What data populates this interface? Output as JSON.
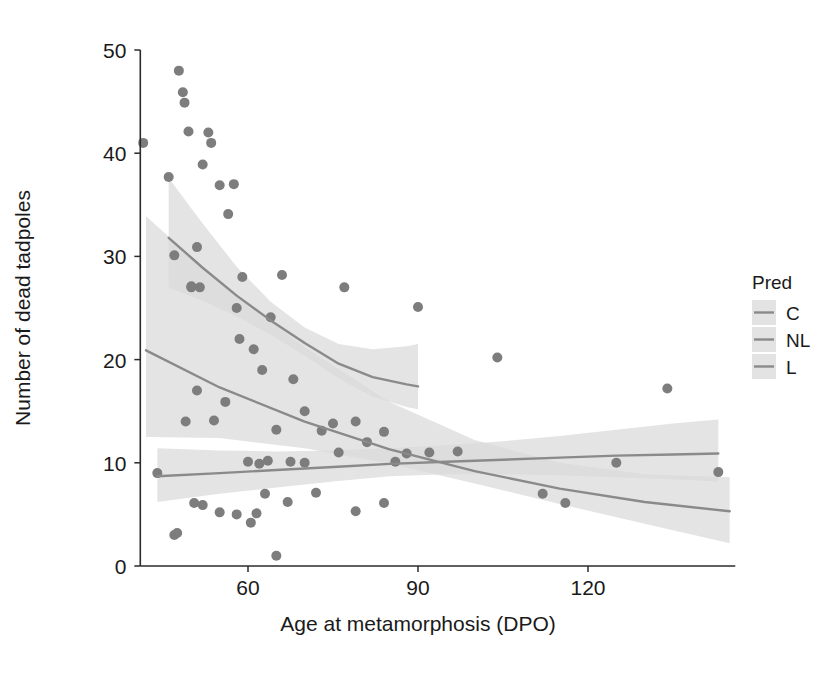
{
  "chart_data": {
    "type": "scatter",
    "title": "",
    "subtitle": "",
    "xlabel": "Age at metamorphosis (DPO)",
    "ylabel": "Number of dead tadpoles",
    "xlim": [
      41,
      146
    ],
    "ylim": [
      0,
      50
    ],
    "xticks": [
      60,
      90,
      120
    ],
    "xtick_labels": [
      "60",
      "90",
      "120"
    ],
    "yticks": [
      0,
      10,
      20,
      30,
      40,
      50
    ],
    "ytick_labels": [
      "0",
      "10",
      "20",
      "30",
      "40",
      "50"
    ],
    "grid": false,
    "legend": {
      "title": "Pred",
      "position": "right",
      "entries": [
        {
          "label": "C",
          "color": "#8a8a8a",
          "band_color": "#d9d9d9"
        },
        {
          "label": "NL",
          "color": "#8a8a8a",
          "band_color": "#d9d9d9"
        },
        {
          "label": "L",
          "color": "#8a8a8a",
          "band_color": "#d9d9d9"
        }
      ]
    },
    "point_color": "#7d7d7d",
    "point_size": 5,
    "series": [
      {
        "name": "C",
        "fit_x": [
          44,
          55,
          65,
          75,
          85,
          95,
          105,
          115,
          125,
          135,
          143
        ],
        "fit_y": [
          8.7,
          9.0,
          9.3,
          9.6,
          9.9,
          10.1,
          10.3,
          10.5,
          10.7,
          10.8,
          10.9
        ],
        "band_lo": [
          6.2,
          7.0,
          7.6,
          8.2,
          8.7,
          8.9,
          8.9,
          8.8,
          8.6,
          8.4,
          8.2
        ],
        "band_hi": [
          11.4,
          11.2,
          11.1,
          11.2,
          11.4,
          11.7,
          12.1,
          12.6,
          13.2,
          13.8,
          14.2
        ],
        "band_x_range": [
          44,
          134
        ],
        "points": [
          {
            "x": 44.0,
            "y": 9.0
          },
          {
            "x": 50.5,
            "y": 6.1
          },
          {
            "x": 52.0,
            "y": 5.9
          },
          {
            "x": 55.0,
            "y": 5.2
          },
          {
            "x": 58.0,
            "y": 5.0
          },
          {
            "x": 60.5,
            "y": 4.2
          },
          {
            "x": 61.5,
            "y": 5.1
          },
          {
            "x": 63.0,
            "y": 7.0
          },
          {
            "x": 65.0,
            "y": 1.0
          },
          {
            "x": 67.0,
            "y": 6.2
          },
          {
            "x": 72.0,
            "y": 7.1
          },
          {
            "x": 79.0,
            "y": 5.3
          },
          {
            "x": 84.0,
            "y": 6.1
          },
          {
            "x": 92.0,
            "y": 11.0
          },
          {
            "x": 97.0,
            "y": 11.1
          },
          {
            "x": 104.0,
            "y": 20.2
          },
          {
            "x": 112.0,
            "y": 7.0
          },
          {
            "x": 116.0,
            "y": 6.1
          },
          {
            "x": 125.0,
            "y": 10.0
          },
          {
            "x": 134.0,
            "y": 17.2
          },
          {
            "x": 143.0,
            "y": 9.1
          }
        ]
      },
      {
        "name": "NL",
        "fit_x": [
          46,
          52,
          58,
          64,
          70,
          76,
          82,
          88,
          90
        ],
        "fit_y": [
          31.8,
          28.9,
          26.2,
          23.8,
          21.6,
          19.6,
          18.3,
          17.6,
          17.4
        ],
        "band_lo": [
          27.0,
          25.7,
          24.2,
          22.4,
          20.4,
          18.2,
          16.4,
          15.4,
          15.2
        ],
        "band_hi": [
          37.6,
          33.2,
          29.0,
          25.6,
          23.1,
          21.5,
          21.0,
          21.3,
          21.5
        ],
        "band_x_range": [
          46,
          90
        ],
        "points": [
          {
            "x": 46.0,
            "y": 37.7
          },
          {
            "x": 47.0,
            "y": 30.1
          },
          {
            "x": 47.8,
            "y": 48.0
          },
          {
            "x": 48.5,
            "y": 45.9
          },
          {
            "x": 48.8,
            "y": 44.9
          },
          {
            "x": 49.5,
            "y": 42.1
          },
          {
            "x": 50.0,
            "y": 27.0
          },
          {
            "x": 51.0,
            "y": 30.9
          },
          {
            "x": 51.5,
            "y": 27.0
          },
          {
            "x": 52.0,
            "y": 38.9
          },
          {
            "x": 53.0,
            "y": 42.0
          },
          {
            "x": 53.5,
            "y": 41.0
          },
          {
            "x": 55.0,
            "y": 36.9
          },
          {
            "x": 56.5,
            "y": 34.1
          },
          {
            "x": 57.5,
            "y": 37.0
          },
          {
            "x": 58.0,
            "y": 25.0
          },
          {
            "x": 59.0,
            "y": 28.0
          },
          {
            "x": 61.0,
            "y": 21.0
          },
          {
            "x": 62.5,
            "y": 19.0
          },
          {
            "x": 64.0,
            "y": 24.1
          },
          {
            "x": 66.0,
            "y": 28.2
          },
          {
            "x": 68.0,
            "y": 18.1
          },
          {
            "x": 70.0,
            "y": 15.0
          },
          {
            "x": 75.0,
            "y": 13.8
          },
          {
            "x": 77.0,
            "y": 27.0
          },
          {
            "x": 79.0,
            "y": 14.0
          },
          {
            "x": 84.0,
            "y": 13.0
          },
          {
            "x": 90.0,
            "y": 25.1
          }
        ]
      },
      {
        "name": "L",
        "fit_x": [
          42,
          55,
          70,
          85,
          100,
          115,
          130,
          145
        ],
        "fit_y": [
          20.9,
          17.3,
          14.0,
          11.3,
          9.2,
          7.5,
          6.2,
          5.3
        ],
        "band_lo": [
          12.5,
          12.4,
          11.4,
          9.9,
          8.0,
          6.0,
          4.1,
          2.2
        ],
        "band_hi": [
          33.9,
          27.5,
          21.2,
          15.9,
          12.2,
          10.0,
          8.9,
          8.6
        ],
        "band_x_range": [
          42,
          145
        ],
        "points": [
          {
            "x": 41.5,
            "y": 41.0
          },
          {
            "x": 47.0,
            "y": 3.0
          },
          {
            "x": 47.5,
            "y": 3.2
          },
          {
            "x": 49.0,
            "y": 14.0
          },
          {
            "x": 50.0,
            "y": 27.1
          },
          {
            "x": 51.0,
            "y": 17.0
          },
          {
            "x": 54.0,
            "y": 14.1
          },
          {
            "x": 56.0,
            "y": 15.9
          },
          {
            "x": 58.5,
            "y": 22.0
          },
          {
            "x": 60.0,
            "y": 10.1
          },
          {
            "x": 62.0,
            "y": 9.9
          },
          {
            "x": 63.5,
            "y": 10.2
          },
          {
            "x": 65.0,
            "y": 13.2
          },
          {
            "x": 67.5,
            "y": 10.1
          },
          {
            "x": 70.0,
            "y": 10.0
          },
          {
            "x": 73.0,
            "y": 13.1
          },
          {
            "x": 76.0,
            "y": 11.0
          },
          {
            "x": 81.0,
            "y": 12.0
          },
          {
            "x": 86.0,
            "y": 10.1
          },
          {
            "x": 88.0,
            "y": 10.9
          }
        ]
      }
    ]
  },
  "axes": {
    "x_axis_name": "x-axis",
    "y_axis_name": "y-axis"
  }
}
